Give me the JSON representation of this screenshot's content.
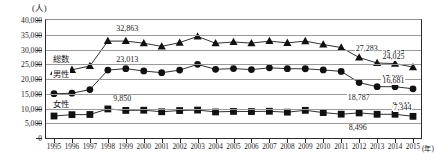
{
  "axes": {
    "y_unit": "(人)",
    "x_unit": "(年)",
    "y_ticks": [
      "40,000",
      "35,000",
      "30,000",
      "25,000",
      "20,000",
      "15,000",
      "10,000",
      "5,000",
      "0"
    ],
    "x_ticks": [
      "1995",
      "1996",
      "1997",
      "1998",
      "1999",
      "2000",
      "2001",
      "2002",
      "2003",
      "2004",
      "2005",
      "2006",
      "2007",
      "2008",
      "2009",
      "2010",
      "2011",
      "2012",
      "2013",
      "2014",
      "2015"
    ]
  },
  "legend": {
    "total": "総数",
    "male": "男性",
    "female": "女性"
  },
  "annotations": {
    "total_1998": "32,863",
    "male_1998": "23,013",
    "female_1998": "9,850",
    "total_2012": "27,283",
    "total_2013": "25,427",
    "total_2015": "24,025",
    "male_2012": "18,787",
    "male_2013": "17,386",
    "male_2015": "16,681",
    "female_2012": "8,496",
    "female_2014": "8,041",
    "female_2015": "7,344"
  },
  "colors": {
    "ink": "#1a1a1a",
    "axis": "#2b2b2b",
    "grid": "#9a9a9a",
    "marker": "#111111"
  },
  "chart_data": {
    "type": "line",
    "title": "",
    "xlabel": "(年)",
    "ylabel": "(人)",
    "ylim": [
      0,
      40000
    ],
    "ytick_step": 5000,
    "grid": true,
    "legend_position": "inline-left",
    "categories": [
      "1995",
      "1996",
      "1997",
      "1998",
      "1999",
      "2000",
      "2001",
      "2002",
      "2003",
      "2004",
      "2005",
      "2006",
      "2007",
      "2008",
      "2009",
      "2010",
      "2011",
      "2012",
      "2013",
      "2014",
      "2015"
    ],
    "series": [
      {
        "name": "総数",
        "marker": "triangle",
        "values": [
          22445,
          23104,
          24391,
          32863,
          32863,
          32143,
          31042,
          32325,
          34427,
          32109,
          32552,
          32155,
          32863,
          32249,
          32845,
          31690,
          30651,
          27283,
          25427,
          25218,
          24025
        ],
        "labeled": {
          "1998": "32,863",
          "2012": "27,283",
          "2013": "25,427",
          "2015": "24,025"
        }
      },
      {
        "name": "男性",
        "marker": "circle",
        "values": [
          14994,
          15189,
          16416,
          23013,
          23512,
          22727,
          22144,
          23016,
          24963,
          23272,
          23540,
          23185,
          23798,
          23490,
          23472,
          23068,
          22581,
          18787,
          17386,
          17386,
          16681
        ],
        "labeled": {
          "1998": "23,013",
          "2012": "18,787",
          "2013": "17,386",
          "2015": "16,681"
        }
      },
      {
        "name": "女性",
        "marker": "square",
        "values": [
          7451,
          7915,
          7975,
          9850,
          9351,
          9416,
          8898,
          9309,
          9464,
          8837,
          9012,
          8970,
          9065,
          8759,
          9373,
          8622,
          8070,
          8496,
          8041,
          8041,
          7344
        ],
        "labeled": {
          "1998": "9,850",
          "2012": "8,496",
          "2014": "8,041",
          "2015": "7,344"
        }
      }
    ]
  }
}
